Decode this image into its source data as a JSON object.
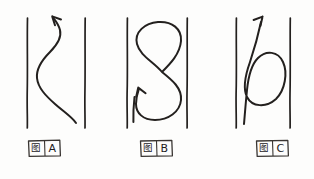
{
  "sheet": {
    "background_color": "#fdfdfc",
    "ink_color": "#23201e",
    "width": 314,
    "height": 179,
    "description": "Hand-drawn figure sheet with three panels showing particle trajectories between two vertical boundary lines"
  },
  "panels": [
    {
      "id": "panel-a",
      "label_cjk": "图",
      "label_letter": "A",
      "label_full": "图 A",
      "left_rail_x": 27,
      "right_rail_x": 85,
      "rail_top_y": 18,
      "rail_bottom_y": 128,
      "curve_shape": "s-curve",
      "curve_description": "Smooth S-shaped curve entering from bottom right, bulging left in the middle, exiting upward with arrowhead",
      "arrow_direction": "up-left",
      "arrow_tip_x": 52,
      "arrow_tip_y": 16
    },
    {
      "id": "panel-b",
      "label_cjk": "图",
      "label_letter": "B",
      "label_full": "图 B",
      "left_rail_x": 127,
      "right_rail_x": 187,
      "rail_top_y": 18,
      "rail_bottom_y": 128,
      "curve_shape": "figure-eight",
      "curve_description": "Closed figure-eight (lemniscate) with crossing point near the middle, arrowhead at lower left",
      "arrow_direction": "up-left",
      "arrow_tip_x": 138,
      "arrow_tip_y": 88,
      "crossing_x": 162,
      "crossing_y": 72
    },
    {
      "id": "panel-c",
      "label_cjk": "图",
      "label_letter": "C",
      "label_full": "图 C",
      "left_rail_x": 236,
      "right_rail_x": 290,
      "rail_top_y": 18,
      "rail_bottom_y": 128,
      "curve_shape": "loop-with-tail",
      "curve_description": "Single closed loop on the right with a straight tail leaving upward to the right, arrowhead at top",
      "arrow_direction": "up-right",
      "arrow_tip_x": 263,
      "arrow_tip_y": 17
    }
  ],
  "labels": [
    {
      "id": "label-a",
      "cjk": "图",
      "letter": "A",
      "box_x": 28,
      "box_y": 140,
      "box_width": 32,
      "box_height": 16
    },
    {
      "id": "label-b",
      "cjk": "图",
      "letter": "B",
      "box_x": 140,
      "box_y": 140,
      "box_width": 32,
      "box_height": 16
    },
    {
      "id": "label-c",
      "cjk": "图",
      "letter": "C",
      "box_x": 256,
      "box_y": 140,
      "box_width": 32,
      "box_height": 16
    }
  ]
}
